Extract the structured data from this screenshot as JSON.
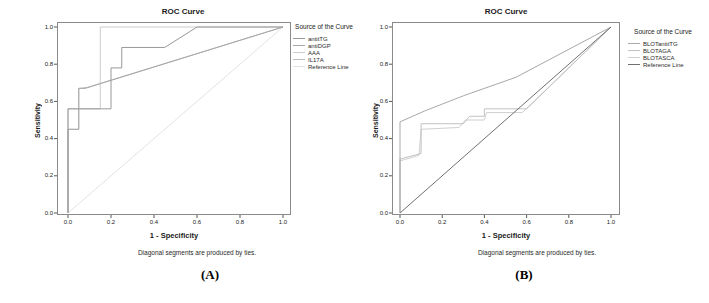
{
  "figure": {
    "panels": [
      {
        "title": "ROC Curve",
        "xlabel": "1 - Specificity",
        "ylabel": "Sensitivity",
        "caption": "Diagonal segments are produced by ties.",
        "panel_label": "(A)",
        "legend_title": "Source of the Curve"
      },
      {
        "title": "ROC Curve",
        "xlabel": "1 - Specificity",
        "ylabel": "Sensitivity",
        "caption": "Diagonal segments are produced by ties.",
        "panel_label": "(B)",
        "legend_title": "Source of the Curve"
      }
    ]
  },
  "chart_data": [
    {
      "type": "line",
      "title": "ROC Curve",
      "xlabel": "1 - Specificity",
      "ylabel": "Sensitivity",
      "xlim": [
        0,
        1
      ],
      "ylim": [
        0,
        1
      ],
      "xticks": [
        0,
        0.2,
        0.4,
        0.6,
        0.8,
        1
      ],
      "xtick_labels": [
        "0.0",
        "0.2",
        "0.4",
        "0.6",
        "0.8",
        "1.0"
      ],
      "yticks": [
        0,
        0.2,
        0.4,
        0.6,
        0.8,
        1
      ],
      "ytick_labels": [
        "0.0",
        "0.2",
        "0.4",
        "0.6",
        "0.8",
        "1.0"
      ],
      "grid": false,
      "legend_position": "right",
      "legend_title": "Source of the Curve",
      "series": [
        {
          "name": "Reference Line",
          "color": "#e2e2e2",
          "points": [
            [
              0,
              0
            ],
            [
              1,
              1
            ]
          ]
        },
        {
          "name": "IL17A",
          "color": "#bdbdbd",
          "points": [
            [
              0,
              0
            ],
            [
              0,
              0.45
            ],
            [
              0.05,
              0.45
            ],
            [
              0.05,
              0.67
            ],
            [
              0.09,
              0.675
            ],
            [
              1,
              1
            ]
          ]
        },
        {
          "name": "AAA",
          "color": "#cccccc",
          "points": [
            [
              0,
              0
            ],
            [
              0,
              0.56
            ],
            [
              0.15,
              0.56
            ],
            [
              0.15,
              1
            ],
            [
              1,
              1
            ]
          ]
        },
        {
          "name": "antiDGP",
          "color": "#a8a8a8",
          "points": [
            [
              0,
              0
            ],
            [
              0,
              0.45
            ],
            [
              0.05,
              0.45
            ],
            [
              0.05,
              0.67
            ],
            [
              0.08,
              0.67
            ],
            [
              1,
              1
            ]
          ]
        },
        {
          "name": "antitTG",
          "color": "#989898",
          "points": [
            [
              0,
              0
            ],
            [
              0,
              0.56
            ],
            [
              0.2,
              0.56
            ],
            [
              0.2,
              0.78
            ],
            [
              0.25,
              0.78
            ],
            [
              0.25,
              0.89
            ],
            [
              0.45,
              0.89
            ],
            [
              0.6,
              1
            ],
            [
              1,
              1
            ]
          ]
        }
      ],
      "legend_order": [
        "antitTG",
        "antiDGP",
        "AAA",
        "IL17A",
        "Reference Line"
      ]
    },
    {
      "type": "line",
      "title": "ROC Curve",
      "xlabel": "1 - Specificity",
      "ylabel": "Sensitivity",
      "xlim": [
        0,
        1
      ],
      "ylim": [
        0,
        1
      ],
      "xticks": [
        0,
        0.2,
        0.4,
        0.6,
        0.8,
        1
      ],
      "xtick_labels": [
        "0.0",
        "0.2",
        "0.4",
        "0.6",
        "0.8",
        "1.0"
      ],
      "yticks": [
        0,
        0.2,
        0.4,
        0.6,
        0.8,
        1
      ],
      "ytick_labels": [
        "0.0",
        "0.2",
        "0.4",
        "0.6",
        "0.8",
        "1.0"
      ],
      "grid": false,
      "legend_position": "right",
      "legend_title": "Source of the Curve",
      "series": [
        {
          "name": "BLOTASCA",
          "color": "#d0d0d0",
          "points": [
            [
              0,
              0
            ],
            [
              0,
              0.28
            ],
            [
              0.09,
              0.31
            ],
            [
              0.1,
              0.45
            ],
            [
              0.28,
              0.46
            ],
            [
              0.31,
              0.5
            ],
            [
              0.4,
              0.5
            ],
            [
              0.41,
              0.54
            ],
            [
              0.58,
              0.54
            ],
            [
              1,
              1
            ]
          ]
        },
        {
          "name": "BLOTAGA",
          "color": "#c2c2c2",
          "points": [
            [
              0,
              0
            ],
            [
              0,
              0.29
            ],
            [
              0.1,
              0.32
            ],
            [
              0.1,
              0.48
            ],
            [
              0.3,
              0.48
            ],
            [
              0.33,
              0.52
            ],
            [
              0.4,
              0.52
            ],
            [
              0.4,
              0.56
            ],
            [
              0.6,
              0.56
            ],
            [
              1,
              1
            ]
          ]
        },
        {
          "name": "BLOTantitTG",
          "color": "#a8a8a8",
          "points": [
            [
              0,
              0
            ],
            [
              0,
              0.49
            ],
            [
              0.12,
              0.55
            ],
            [
              0.3,
              0.63
            ],
            [
              0.55,
              0.73
            ],
            [
              1,
              1
            ]
          ]
        },
        {
          "name": "Reference Line",
          "color": "#707070",
          "points": [
            [
              0,
              0
            ],
            [
              1,
              1
            ]
          ]
        }
      ],
      "legend_order": [
        "BLOTantitTG",
        "BLOTAGA",
        "BLOTASCA",
        "Reference Line"
      ]
    }
  ]
}
